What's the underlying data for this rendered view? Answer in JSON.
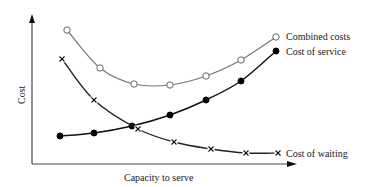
{
  "chart_data": {
    "type": "line",
    "title": "",
    "xlabel": "Capacity to serve",
    "ylabel": "Cost",
    "grid": false,
    "legend": "inline labels at right end of curves",
    "x": [
      1,
      2,
      3,
      4,
      5,
      6,
      7
    ],
    "series": [
      {
        "name": "Combined costs",
        "marker": "open-circle",
        "color": "#777777",
        "points": [
          [
            67,
            30
          ],
          [
            100,
            68
          ],
          [
            134,
            84
          ],
          [
            170,
            85
          ],
          [
            206,
            76
          ],
          [
            241,
            60
          ],
          [
            276,
            37
          ]
        ]
      },
      {
        "name": "Cost of service",
        "marker": "filled-circle",
        "color": "#111111",
        "points": [
          [
            60,
            136
          ],
          [
            94,
            133
          ],
          [
            132,
            126
          ],
          [
            170,
            115
          ],
          [
            206,
            100
          ],
          [
            241,
            81
          ],
          [
            276,
            51
          ]
        ]
      },
      {
        "name": "Cost of waiting",
        "marker": "x",
        "color": "#222222",
        "points": [
          [
            62,
            59
          ],
          [
            94,
            100
          ],
          [
            138,
            129
          ],
          [
            174,
            142
          ],
          [
            211,
            149
          ],
          [
            246,
            153
          ],
          [
            278,
            153
          ]
        ]
      }
    ]
  },
  "labels": {
    "combined": "Combined costs",
    "service": "Cost of service",
    "waiting": "Cost of waiting",
    "xaxis": "Capacity to serve",
    "yaxis": "Cost"
  }
}
